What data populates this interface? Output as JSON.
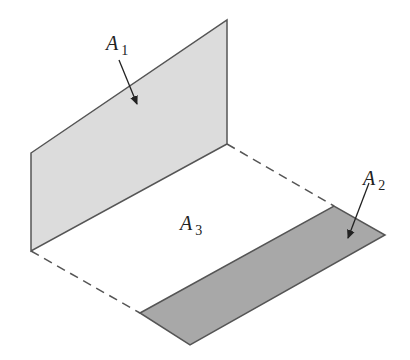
{
  "diagram": {
    "colors": {
      "background": "#ffffff",
      "panel_a1_fill": "#dcdcdc",
      "panel_a2_fill": "#a8a8a8",
      "edge_stroke": "#555555",
      "dashed_stroke": "#555555",
      "arrow_stroke": "#222222",
      "text": "#222222"
    },
    "labels": {
      "a1": {
        "main": "A",
        "sub": "1"
      },
      "a2": {
        "main": "A",
        "sub": "2"
      },
      "a3": {
        "main": "A",
        "sub": "3"
      }
    },
    "shapes": {
      "panel_a1": {
        "name": "vertical-panel",
        "points": [
          [
            31,
            153
          ],
          [
            227,
            20
          ],
          [
            227,
            144
          ],
          [
            31,
            251
          ]
        ]
      },
      "panel_a2": {
        "name": "floor-panel",
        "points": [
          [
            140,
            313
          ],
          [
            334,
            206
          ],
          [
            385,
            235
          ],
          [
            190,
            345
          ]
        ]
      },
      "dashed_edges": [
        {
          "name": "dashed-edge-top",
          "from": [
            227,
            144
          ],
          "to": [
            334,
            206
          ]
        },
        {
          "name": "dashed-edge-bottom",
          "from": [
            31,
            251
          ],
          "to": [
            140,
            313
          ]
        }
      ],
      "arrows": [
        {
          "name": "arrow-a1",
          "from": [
            119,
            60
          ],
          "to": [
            137,
            104
          ]
        },
        {
          "name": "arrow-a2",
          "from": [
            369,
            183
          ],
          "to": [
            348,
            238
          ]
        }
      ]
    }
  }
}
